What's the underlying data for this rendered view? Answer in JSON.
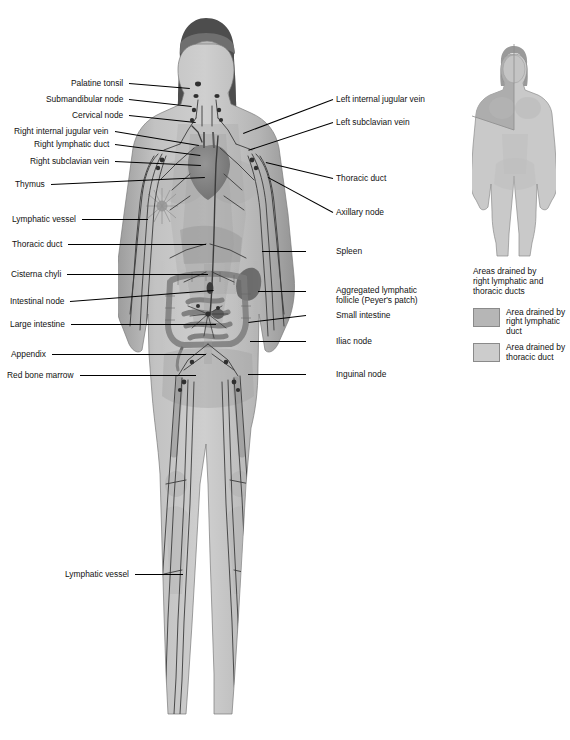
{
  "figure": {
    "colors": {
      "skin_light": "#c9c9c9",
      "skin_mid": "#a9a9a9",
      "skin_dark": "#8d8d8d",
      "vessel": "#3a3a3a",
      "organ": "#8a8a8a",
      "outline": "#6e6e6e",
      "leader": "#000000",
      "text": "#111111",
      "background": "#ffffff",
      "swatch_right_duct": "#b6b6b6",
      "swatch_thoracic_duct": "#cccccc"
    }
  },
  "labels_left": [
    {
      "text": "Palatine tonsil",
      "x": 60,
      "y": 79,
      "lx": 129,
      "ly": 83,
      "tx": 190,
      "ty": 88
    },
    {
      "text": "Submandibular node",
      "x": 35,
      "y": 95,
      "lx": 129,
      "ly": 99,
      "tx": 192,
      "ty": 106
    },
    {
      "text": "Cervical node",
      "x": 63,
      "y": 111,
      "lx": 129,
      "ly": 115,
      "tx": 196,
      "ty": 122
    },
    {
      "text": "Right internal jugular vein",
      "x": 2,
      "y": 127,
      "lx": 115,
      "ly": 131,
      "tx": 199,
      "ty": 145
    },
    {
      "text": "Right lymphatic duct",
      "x": 21,
      "y": 140,
      "lx": 115,
      "ly": 144,
      "tx": 200,
      "ty": 155
    },
    {
      "text": "Right subclavian vein",
      "x": 15,
      "y": 157,
      "lx": 115,
      "ly": 161,
      "tx": 201,
      "ty": 165
    },
    {
      "text": "Thymus",
      "x": 5,
      "y": 180,
      "lx": 51,
      "ly": 184,
      "tx": 205,
      "ty": 177
    },
    {
      "text": "Lymphatic vessel",
      "x": 5,
      "y": 215,
      "lx": 82,
      "ly": 219,
      "tx": 148,
      "ty": 219
    },
    {
      "text": "Thoracic duct",
      "x": 5,
      "y": 240,
      "lx": 68,
      "ly": 244,
      "tx": 206,
      "ty": 244
    },
    {
      "text": "Cisterna chyli",
      "x": 5,
      "y": 270,
      "lx": 67,
      "ly": 274,
      "tx": 208,
      "ty": 274
    },
    {
      "text": "Intestinal node",
      "x": 5,
      "y": 297,
      "lx": 70,
      "ly": 301,
      "tx": 214,
      "ty": 290
    },
    {
      "text": "Large intestine",
      "x": 5,
      "y": 320,
      "lx": 71,
      "ly": 324,
      "tx": 216,
      "ty": 324
    },
    {
      "text": "Appendix",
      "x": 5,
      "y": 350,
      "lx": 52,
      "ly": 354,
      "tx": 206,
      "ty": 354
    },
    {
      "text": "Red bone marrow",
      "x": 5,
      "y": 371,
      "lx": 80,
      "ly": 375,
      "tx": 196,
      "ty": 375
    },
    {
      "text": "Lymphatic vessel",
      "x": 58,
      "y": 570,
      "lx": 135,
      "ly": 574,
      "tx": 183,
      "ty": 574
    }
  ],
  "labels_right": [
    {
      "text": "Left internal jugular vein",
      "x": 336,
      "y": 95,
      "lx": 333,
      "ly": 99,
      "tx": 243,
      "ty": 133
    },
    {
      "text": "Left subclavian vein",
      "x": 336,
      "y": 118,
      "lx": 333,
      "ly": 122,
      "tx": 248,
      "ty": 150
    },
    {
      "text": "Thoracic duct",
      "x": 336,
      "y": 174,
      "lx": 333,
      "ly": 178,
      "tx": 266,
      "ty": 162
    },
    {
      "text": "Axillary node",
      "x": 336,
      "y": 208,
      "lx": 333,
      "ly": 212,
      "tx": 268,
      "ty": 177
    },
    {
      "text": "Spleen",
      "x": 336,
      "y": 247,
      "lx": 306,
      "ly": 251,
      "tx": 262,
      "ty": 251
    },
    {
      "text": "Aggregated lymphatic\nfollicle (Peyer's patch)",
      "x": 336,
      "y": 286,
      "lx": 306,
      "ly": 291,
      "tx": 258,
      "ty": 291,
      "wrap": true
    },
    {
      "text": "Small intestine",
      "x": 336,
      "y": 311,
      "lx": 306,
      "ly": 315,
      "tx": 248,
      "ty": 322
    },
    {
      "text": "Iliac node",
      "x": 336,
      "y": 337,
      "lx": 306,
      "ly": 341,
      "tx": 250,
      "ty": 341
    },
    {
      "text": "Inguinal node",
      "x": 336,
      "y": 370,
      "lx": 306,
      "ly": 374,
      "tx": 248,
      "ty": 374
    }
  ],
  "legend": {
    "caption": "Areas drained by\nright lymphatic and\nthoracic ducts",
    "items": [
      {
        "label": "Area drained by\nright lymphatic duct",
        "color": "#b6b6b6"
      },
      {
        "label": "Area drained by\nthoracic duct",
        "color": "#cccccc"
      }
    ]
  }
}
